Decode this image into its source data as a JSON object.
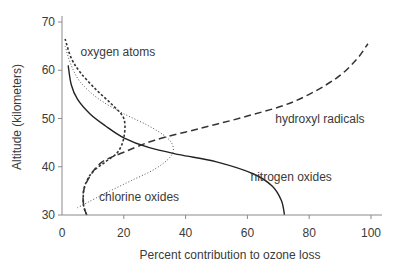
{
  "chart_data": {
    "type": "line",
    "title": "",
    "xlabel": "Percent contribution to ozone loss",
    "ylabel": "Altitude (kilometers)",
    "xlim": [
      0,
      100
    ],
    "ylim": [
      30,
      70
    ],
    "xticks": [
      0,
      20,
      40,
      60,
      80,
      100
    ],
    "yticks": [
      30,
      40,
      50,
      60,
      70
    ],
    "grid": false,
    "legend": "inline labels",
    "series": [
      {
        "name": "nitrogen oxides",
        "style": "solid",
        "label_pos": [
          61,
          37
        ],
        "points": [
          [
            72,
            30
          ],
          [
            71,
            33
          ],
          [
            68,
            36
          ],
          [
            62,
            38.5
          ],
          [
            50,
            41
          ],
          [
            38,
            42.5
          ],
          [
            28,
            44
          ],
          [
            20,
            46
          ],
          [
            14,
            48.5
          ],
          [
            9,
            51
          ],
          [
            5,
            54
          ],
          [
            3,
            57
          ],
          [
            2,
            61
          ]
        ]
      },
      {
        "name": "hydroxyl radicals",
        "style": "dashed",
        "label_pos": [
          69,
          49
        ],
        "points": [
          [
            8,
            30
          ],
          [
            7,
            32
          ],
          [
            7,
            35
          ],
          [
            9,
            38
          ],
          [
            13,
            41
          ],
          [
            20,
            43
          ],
          [
            30,
            45.5
          ],
          [
            45,
            48
          ],
          [
            60,
            50.5
          ],
          [
            75,
            53.5
          ],
          [
            88,
            58
          ],
          [
            95,
            62
          ],
          [
            99,
            65.5
          ]
        ]
      },
      {
        "name": "oxygen atoms",
        "style": "dotted-heavy",
        "label_pos": [
          6,
          63
        ],
        "points": [
          [
            8,
            30
          ],
          [
            7,
            32
          ],
          [
            7,
            35
          ],
          [
            8,
            37
          ],
          [
            10,
            39
          ],
          [
            14,
            41
          ],
          [
            18,
            43
          ],
          [
            20,
            46
          ],
          [
            20,
            50
          ],
          [
            16,
            53
          ],
          [
            11,
            56
          ],
          [
            6,
            59.5
          ],
          [
            3,
            62.5
          ],
          [
            1,
            66.5
          ]
        ]
      },
      {
        "name": "chlorine oxides",
        "style": "dotted-light",
        "label_pos": [
          12,
          33
        ],
        "points": [
          [
            5,
            31.5
          ],
          [
            8,
            32.5
          ],
          [
            14,
            34.5
          ],
          [
            22,
            37
          ],
          [
            30,
            39.5
          ],
          [
            35,
            42
          ],
          [
            36,
            44
          ],
          [
            34,
            46
          ],
          [
            28,
            48.5
          ],
          [
            20,
            51
          ],
          [
            12,
            54
          ],
          [
            6,
            57.5
          ],
          [
            3,
            61
          ],
          [
            1,
            65
          ]
        ]
      }
    ]
  }
}
